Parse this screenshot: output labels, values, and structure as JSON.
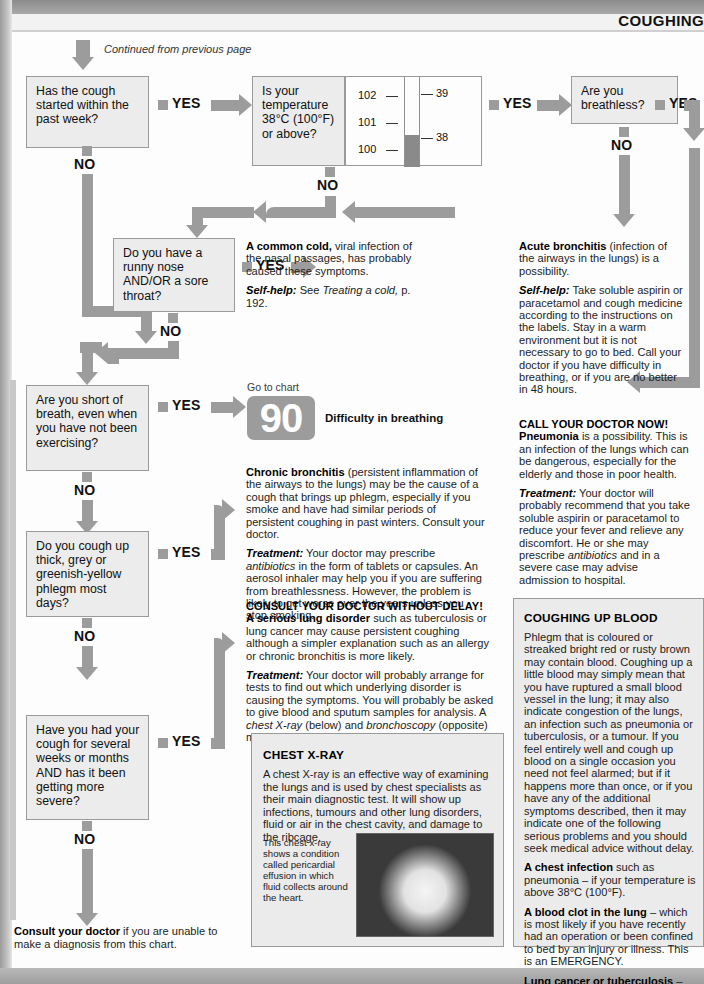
{
  "header": {
    "title": "COUGHING"
  },
  "continued_note": "Continued from previous page",
  "labels": {
    "yes": "YES",
    "no": "NO"
  },
  "questions": {
    "q1": "Has the cough started within the past week?",
    "q2": "Is your temperature 38°C (100°F) or above?",
    "q3": "Are you breathless?",
    "q4": "Do you have a runny nose AND/OR a sore throat?",
    "q5": "Are you short of breath, even when you have not been exercising?",
    "q6": "Do you cough up thick, grey or greenish-yellow phlegm most days?",
    "q7": "Have you had your cough for several weeks or months AND has it been getting more severe?"
  },
  "thermometer": {
    "fahrenheit_ticks": [
      "102",
      "101",
      "100"
    ],
    "celsius_ticks": [
      "39",
      "38"
    ],
    "mercury_reading": "38"
  },
  "goto_chart": {
    "prefix": "Go to chart",
    "number": "90",
    "caption": "Difficulty in breathing"
  },
  "outcomes": {
    "common_cold": {
      "lead": "A common cold,",
      "body": " viral infection of the nasal passages, has probably caused these symptoms.",
      "selfhelp_label": "Self-help:",
      "selfhelp_body": " See ",
      "selfhelp_italic": "Treating a cold,",
      "selfhelp_tail": " p. 192."
    },
    "acute_bronchitis": {
      "lead": "Acute bronchitis",
      "body": " (infection of the airways in the lungs) is a possibility.",
      "selfhelp_label": "Self-help:",
      "selfhelp_body": " Take soluble aspirin or paracetamol and cough medicine according to the instructions on the labels. Stay in a warm environment but it is not necessary to go to bed. Call your doctor if you have difficulty in breathing, or if you are no better in 48 hours."
    },
    "pneumonia": {
      "alert": "CALL YOUR DOCTOR NOW!",
      "lead": "Pneumonia",
      "body": " is a possibility. This is an infection of the lungs which can be dangerous, especially for the elderly and those in poor health.",
      "treatment_label": "Treatment:",
      "treatment_a": " Your doctor will probably recommend that you take soluble aspirin or paracetamol to reduce your fever and relieve any discomfort. He or she may prescribe ",
      "treatment_italic": "antibiotics",
      "treatment_b": " and in a severe case may advise admission to hospital."
    },
    "chronic_bronchitis": {
      "lead": "Chronic bronchitis",
      "body": " (persistent inflammation of the airways to the lungs) may be the cause of a cough that brings up phlegm, especially if you smoke and have had similar periods of persistent coughing in past winters. Consult your doctor.",
      "treatment_label": "Treatment:",
      "treatment_a": " Your doctor may prescribe ",
      "treatment_italic": "antibiotics",
      "treatment_b": " in the form of tablets or capsules. An aerosol inhaler may help you if you are suffering from breathlessness. However, the problem is likely to get worse over the years unless you stop smoking."
    },
    "serious_lung_disorder": {
      "alert": "CONSULT YOUR DOCTOR WITHOUT DELAY!",
      "lead": "A serious lung disorder",
      "body": " such as tuberculosis or lung cancer may cause persistent coughing although a simpler explanation such as an allergy or chronic bronchitis is more likely.",
      "treatment_label": "Treatment:",
      "treatment_a": " Your doctor will probably arrange for tests to find out which underlying disorder is causing the symptoms. You will probably be asked to give blood and sputum samples for analysis. A ",
      "treatment_italic_1": "chest X-ray",
      "treatment_mid": " (below) and ",
      "treatment_italic_2": "bronchoscopy",
      "treatment_b": " (opposite) may also be needed."
    }
  },
  "chest_xray_panel": {
    "title": "CHEST X-RAY",
    "body": "A chest X-ray is an effective way of examining the lungs and is used by chest specialists as their main diagnostic test. It will show up infections, tumours and other lung disorders, fluid or air in the chest cavity, and damage to the ribcage.",
    "image_caption": "This chest x-ray shows a condition called pericardial effusion in which fluid collects around the heart."
  },
  "coughing_up_blood_panel": {
    "title": "COUGHING UP BLOOD",
    "intro": "Phlegm that is coloured or streaked bright red or rusty brown may contain blood. Coughing up a little blood may simply mean that you have ruptured a small blood vessel in the lung; it may also indicate congestion of the lungs, an infection such as pneumonia or tuberculosis, or a tumour. If you feel entirely well and cough up blood on a single occasion you need not feel alarmed; but if it happens more than once, or if you have any of the additional symptoms described, then it may indicate one of the following serious problems and you should seek medical advice without delay.",
    "item1_lead": "A chest infection",
    "item1_body": " such as pneumonia – if your temperature is above 38°C (100°F).",
    "item2_lead": "A blood clot in the lung",
    "item2_body": " – which is most likely if you have recently had an operation or been confined to bed by an injury or illness. This is an EMERGENCY.",
    "item3_lead": "Lung cancer or tuberculosis",
    "item3_body": " – especially if you have had a cough for many weeks or months."
  },
  "footer_note": {
    "lead": "Consult your doctor",
    "body": " if you are unable to make a diagnosis from this chart."
  },
  "colors": {
    "arrow_grey": "#9c9c9c",
    "box_fill": "#ececec",
    "panel_fill": "#ebebeb",
    "page_bg": "#fdfdfd"
  }
}
